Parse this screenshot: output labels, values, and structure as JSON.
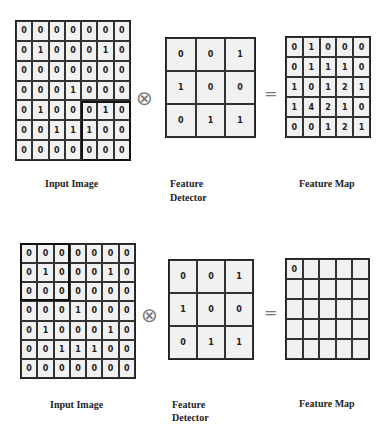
{
  "diagram_top": {
    "input_image": [
      [
        0,
        0,
        0,
        0,
        0,
        0,
        0
      ],
      [
        0,
        1,
        0,
        0,
        0,
        1,
        0
      ],
      [
        0,
        0,
        0,
        0,
        0,
        0,
        0
      ],
      [
        0,
        0,
        0,
        1,
        0,
        0,
        0
      ],
      [
        0,
        1,
        0,
        0,
        0,
        1,
        0
      ],
      [
        0,
        0,
        1,
        1,
        1,
        0,
        0
      ],
      [
        0,
        0,
        0,
        0,
        0,
        0,
        0
      ]
    ],
    "highlight_region": {
      "row": 4,
      "col": 4,
      "size": 3
    },
    "feature_detector": [
      [
        0,
        0,
        1
      ],
      [
        1,
        0,
        0
      ],
      [
        0,
        1,
        1
      ]
    ],
    "feature_map": [
      [
        0,
        1,
        0,
        0,
        0
      ],
      [
        0,
        1,
        1,
        1,
        0
      ],
      [
        1,
        0,
        1,
        2,
        1
      ],
      [
        1,
        4,
        2,
        1,
        0
      ],
      [
        0,
        0,
        1,
        2,
        1
      ]
    ],
    "operator_symbol": "⊗",
    "equals_symbol": "=",
    "labels": {
      "input": "Input Image",
      "detector_line1": "Feature",
      "detector_line2": "Detector",
      "map": "Feature Map"
    }
  },
  "diagram_bottom": {
    "input_image": [
      [
        0,
        0,
        0,
        0,
        0,
        0,
        0
      ],
      [
        0,
        1,
        0,
        0,
        0,
        1,
        0
      ],
      [
        0,
        0,
        0,
        0,
        0,
        0,
        0
      ],
      [
        0,
        0,
        0,
        1,
        0,
        0,
        0
      ],
      [
        0,
        1,
        0,
        0,
        0,
        1,
        0
      ],
      [
        0,
        0,
        1,
        1,
        1,
        0,
        0
      ],
      [
        0,
        0,
        0,
        0,
        0,
        0,
        0
      ]
    ],
    "highlight_region": {
      "row": 0,
      "col": 0,
      "size": 3
    },
    "feature_detector": [
      [
        0,
        0,
        1
      ],
      [
        1,
        0,
        0
      ],
      [
        0,
        1,
        1
      ]
    ],
    "feature_map": [
      [
        "0",
        "",
        "",
        "",
        ""
      ],
      [
        "",
        "",
        "",
        "",
        ""
      ],
      [
        "",
        "",
        "",
        "",
        ""
      ],
      [
        "",
        "",
        "",
        "",
        ""
      ],
      [
        "",
        "",
        "",
        "",
        ""
      ]
    ],
    "operator_symbol": "⊗",
    "equals_symbol": "=",
    "labels": {
      "input": "Input Image",
      "detector_line1": "Feature",
      "detector_line2": "Detector",
      "map": "Feature Map"
    }
  }
}
